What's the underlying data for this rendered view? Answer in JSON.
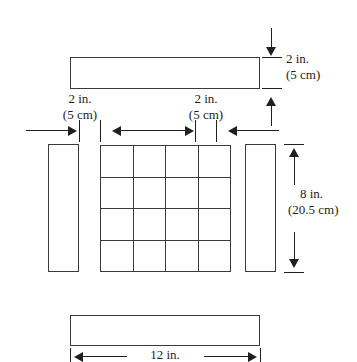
{
  "figure": {
    "title_text": "",
    "background_color": "#ffffff",
    "line_color": "#3a3a3a",
    "text_color": "#231f20"
  },
  "parts": {
    "top_bar": {
      "name": "top-horizontal-bar"
    },
    "left_bar": {
      "name": "left-vertical-bar"
    },
    "right_bar": {
      "name": "right-vertical-bar"
    },
    "bottom_bar": {
      "name": "bottom-horizontal-bar"
    },
    "grid": {
      "rows": 4,
      "cols": 4
    }
  },
  "dimensions": {
    "top_left_gap": {
      "inches": "2 in.",
      "centimeters": "(5 cm)"
    },
    "top_right_gap": {
      "inches": "2 in.",
      "centimeters": "(5 cm)"
    },
    "bar_thickness": {
      "inches": "2 in.",
      "centimeters": "(5 cm)"
    },
    "height": {
      "inches": "8 in.",
      "centimeters": "(20.5 cm)"
    },
    "width": {
      "inches": "12 in.",
      "centimeters": ""
    }
  }
}
